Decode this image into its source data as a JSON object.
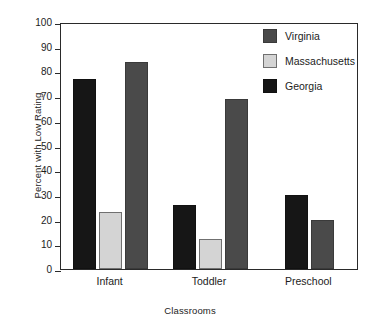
{
  "chart_data": {
    "type": "bar",
    "title": "",
    "xlabel": "Classrooms",
    "ylabel": "Percent with Low Rating",
    "categories": [
      "Infant",
      "Toddler",
      "Preschool"
    ],
    "series": [
      {
        "name": "Virginia",
        "color": "#4a4a4a",
        "values": [
          84,
          69,
          20
        ]
      },
      {
        "name": "Massachusetts",
        "color": "#d4d4d4",
        "values": [
          23,
          12,
          null
        ]
      },
      {
        "name": "Georgia",
        "color": "#161616",
        "values": [
          77,
          26,
          30
        ]
      }
    ],
    "draw_order": [
      "Georgia",
      "Massachusetts",
      "Virginia"
    ],
    "ylim": [
      0,
      100
    ],
    "yticks": [
      0,
      10,
      20,
      30,
      40,
      50,
      60,
      70,
      80,
      90,
      100
    ],
    "ytick_labels": [
      "0",
      "10",
      "20",
      "30",
      "40",
      "50",
      "60",
      "70",
      "80",
      "90",
      "100"
    ],
    "grid": false,
    "legend_position": "top-right-inside",
    "legend_entries": [
      "Virginia",
      "Massachusetts",
      "Georgia"
    ]
  },
  "axes": {
    "y_title": "Percent with Low Rating",
    "x_title": "Classrooms"
  },
  "legend": {
    "items": [
      {
        "label": "Virginia",
        "swatch": "virginia"
      },
      {
        "label": "Massachusetts",
        "swatch": "massachusetts"
      },
      {
        "label": "Georgia",
        "swatch": "georgia"
      }
    ]
  },
  "colors": {
    "virginia": "#4a4a4a",
    "massachusetts": "#d4d4d4",
    "georgia": "#161616",
    "frame": "#2a2a2a",
    "background": "#ffffff",
    "text": "#1c1c1c"
  }
}
